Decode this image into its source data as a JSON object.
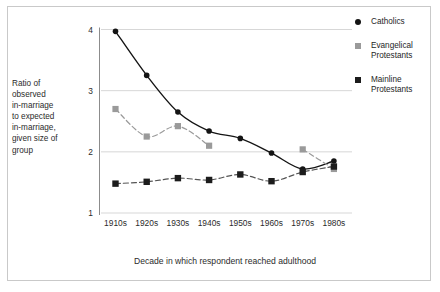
{
  "chart_data": {
    "type": "line",
    "title": "",
    "xlabel": "Decade in which respondent reached adulthood",
    "ylabel": "Ratio of observed in-marriage to expected in-marriage, given size of group",
    "categories": [
      "1910s",
      "1920s",
      "1930s",
      "1940s",
      "1950s",
      "1960s",
      "1970s",
      "1980s"
    ],
    "ylim": [
      1,
      4
    ],
    "yticks": [
      "1",
      "2",
      "3",
      "4"
    ],
    "grid": true,
    "legend_position": "right",
    "series": [
      {
        "name": "Catholics",
        "marker": "circle",
        "color": "#141414",
        "values": [
          3.97,
          3.25,
          2.65,
          2.34,
          2.22,
          1.98,
          1.72,
          1.85
        ]
      },
      {
        "name": "Evangelical Protestants",
        "marker": "square",
        "color": "#9a9a9a",
        "values": [
          2.7,
          2.25,
          2.42,
          2.1,
          null,
          null,
          2.04,
          1.72
        ]
      },
      {
        "name": "Mainline Protestants",
        "marker": "square",
        "color": "#1c1c1c",
        "values": [
          1.48,
          1.51,
          1.57,
          1.54,
          1.63,
          1.52,
          1.67,
          1.76
        ]
      }
    ]
  },
  "axes": {
    "y_label_lines": [
      "Ratio of",
      "observed",
      "in-marriage",
      "to expected",
      "in-marriage,",
      "given size of",
      "group"
    ],
    "y_ticks": [
      "4",
      "3",
      "2",
      "1"
    ],
    "x_ticks": [
      "1910s",
      "1920s",
      "1930s",
      "1940s",
      "1950s",
      "1960s",
      "1970s",
      "1980s"
    ],
    "x_title": "Decade in which respondent reached adulthood"
  },
  "legend": {
    "items": [
      {
        "label": "Catholics",
        "marker": "circle",
        "color": "#141414"
      },
      {
        "label": "Evangelical Protestants",
        "marker": "square",
        "color": "#9a9a9a"
      },
      {
        "label": "Mainline Protestants",
        "marker": "square",
        "color": "#1c1c1c"
      }
    ]
  },
  "colors": {
    "catholics": "#141414",
    "evangelical": "#9a9a9a",
    "mainline": "#1c1c1c",
    "gridline": "#d2d2d2",
    "frame": "#c9c9c9",
    "text": "#2b2b2b"
  }
}
